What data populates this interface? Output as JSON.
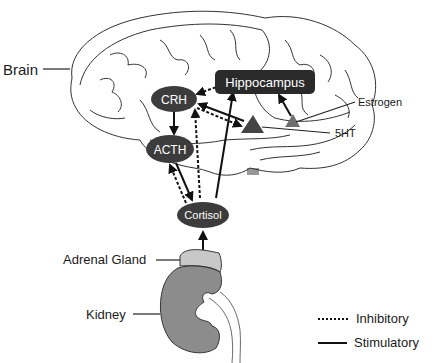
{
  "labels": {
    "brain": "Brain",
    "adrenal_gland": "Adrenal Gland",
    "kidney": "Kidney",
    "estrogen": "Estrogen",
    "serotonin": "5HT"
  },
  "nodes": {
    "hippocampus": "Hippocampus",
    "crh": "CRH",
    "acth": "ACTH",
    "cortisol": "Cortisol"
  },
  "legend": {
    "inhibitory": "Inhibitory",
    "stimulatory": "Stimulatory"
  },
  "colors": {
    "node_fill": "#3c3c3c",
    "hippocampus_fill": "#2a2a2a",
    "serotonin_triangle": "#444444",
    "estrogen_triangle": "#6e6e6e",
    "kidney_fill": "#8c8c8c",
    "adrenal_fill": "#c8c8c8",
    "outline": "#222222"
  },
  "relations": [
    {
      "from": "Hippocampus",
      "to": "CRH",
      "type": "inhibitory"
    },
    {
      "from": "CRH",
      "to": "ACTH",
      "type": "stimulatory"
    },
    {
      "from": "5HT",
      "to": "CRH",
      "type": "stimulatory"
    },
    {
      "from": "CRH",
      "to": "5HT",
      "type": "inhibitory"
    },
    {
      "from": "ACTH",
      "to": "Cortisol",
      "type": "stimulatory"
    },
    {
      "from": "Cortisol",
      "to": "ACTH",
      "type": "inhibitory"
    },
    {
      "from": "Cortisol",
      "to": "CRH",
      "type": "inhibitory"
    },
    {
      "from": "Cortisol",
      "to": "Hippocampus",
      "type": "stimulatory"
    },
    {
      "from": "Estrogen",
      "to": "Hippocampus",
      "type": "stimulatory"
    },
    {
      "from": "Adrenal Gland",
      "to": "Cortisol",
      "type": "stimulatory"
    }
  ]
}
